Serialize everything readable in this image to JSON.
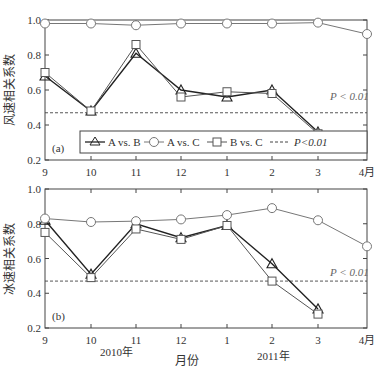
{
  "chart_data": [
    {
      "type": "line",
      "panel_label": "(a)",
      "ylabel": "风速相关系数",
      "xlabel": "",
      "categories": [
        "9",
        "10",
        "11",
        "12",
        "1",
        "2",
        "3",
        "4月"
      ],
      "ylim": [
        0.2,
        1.0
      ],
      "yticks": [
        "0.2",
        "0.4",
        "0.6",
        "0.8",
        "1.0"
      ],
      "series": [
        {
          "name": "A vs. B",
          "marker": "triangle",
          "values": [
            0.68,
            0.48,
            0.81,
            0.6,
            0.56,
            0.6,
            0.36,
            null
          ]
        },
        {
          "name": "A vs. C",
          "marker": "circle",
          "values": [
            0.98,
            0.98,
            0.97,
            0.98,
            0.98,
            0.98,
            0.985,
            0.92
          ]
        },
        {
          "name": "B vs. C",
          "marker": "square",
          "values": [
            0.7,
            0.48,
            0.86,
            0.56,
            0.59,
            0.58,
            0.35,
            null
          ]
        }
      ],
      "threshold": {
        "label": "P < 0.01",
        "value": 0.47,
        "style": "dashed"
      },
      "legend": [
        "A vs. B",
        "A vs. C",
        "B vs. C",
        "P<0.01"
      ],
      "legend_position": "bottom inside"
    },
    {
      "type": "line",
      "panel_label": "(b)",
      "ylabel": "冰速相关系数",
      "xlabel": "月份",
      "categories": [
        "9",
        "10",
        "11",
        "12",
        "1",
        "2",
        "3",
        "4月"
      ],
      "year_labels": [
        "2010年",
        "2011年"
      ],
      "ylim": [
        0.2,
        1.0
      ],
      "yticks": [
        "0.2",
        "0.4",
        "0.6",
        "0.8",
        "1.0"
      ],
      "series": [
        {
          "name": "A vs. B",
          "marker": "triangle",
          "values": [
            0.82,
            0.51,
            0.8,
            0.72,
            0.79,
            0.57,
            0.31,
            null
          ]
        },
        {
          "name": "A vs. C",
          "marker": "circle",
          "values": [
            0.83,
            0.81,
            0.815,
            0.825,
            0.85,
            0.89,
            0.82,
            0.67
          ]
        },
        {
          "name": "B vs. C",
          "marker": "square",
          "values": [
            0.75,
            0.49,
            0.77,
            0.71,
            0.79,
            0.47,
            0.28,
            null
          ]
        }
      ],
      "threshold": {
        "label": "P < 0.01",
        "value": 0.47,
        "style": "dashed"
      }
    }
  ],
  "labels": {
    "panel_a": "(a)",
    "panel_b": "(b)",
    "ylabel_a": "风速相关系数",
    "ylabel_b": "冰速相关系数",
    "xlabel": "月份",
    "year_2010": "2010年",
    "year_2011": "2011年",
    "threshold_a": "P < 0.01",
    "threshold_b": "P < 0.01",
    "legend": {
      "ab": "A vs. B",
      "ac": "A vs. C",
      "bc": "B vs. C",
      "p": "P<0.01"
    }
  },
  "colors": {
    "ab": "#222222",
    "ac": "#777777",
    "bc": "#555555",
    "threshold": "#444444",
    "axis": "#444444"
  }
}
